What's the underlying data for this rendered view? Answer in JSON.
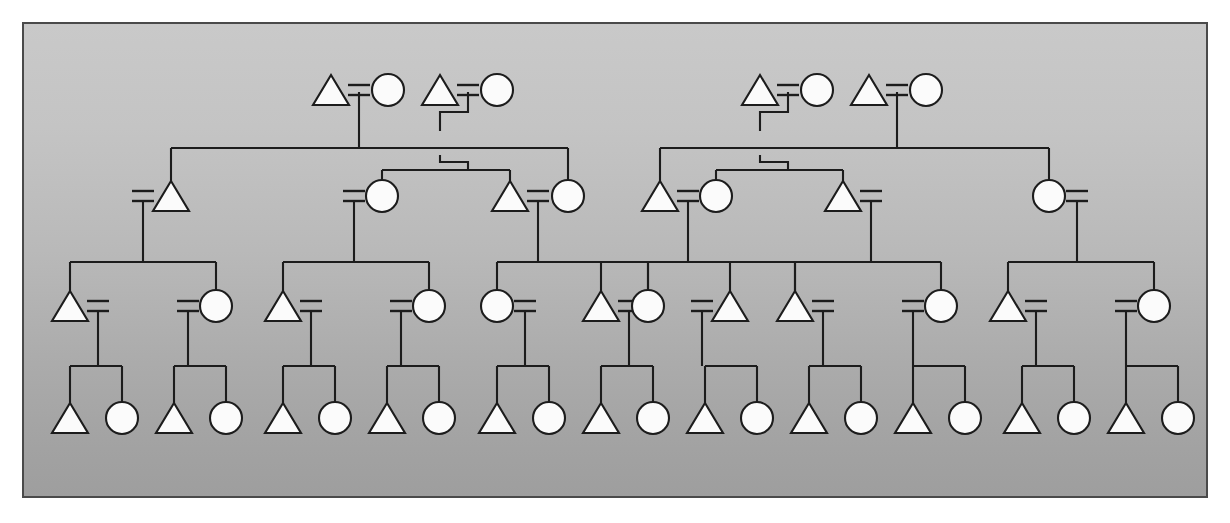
{
  "figure": {
    "panel": {
      "x": 22,
      "y": 22,
      "width": 1186,
      "height": 476,
      "border_color": "#4a4a4a",
      "background_top_color": "#c9c9c9",
      "background_bottom_color": "#9e9e9e"
    },
    "symbol_legend": {
      "triangle": "male",
      "circle": "female",
      "equals": "marriage-union",
      "vertical_line": "descent-line",
      "horizontal_line": "sibling-bar"
    },
    "stroke_color": "#1c1c1c",
    "shape_fill_color": "#fbfbfb",
    "generation_count": 4,
    "generations": [
      {
        "label": "generation-1",
        "y": 90,
        "node_count": 4
      },
      {
        "label": "generation-2",
        "y": 196,
        "node_count": 8
      },
      {
        "label": "generation-3",
        "y": 306,
        "node_count": 14
      },
      {
        "label": "generation-4",
        "y": 418,
        "node_count": 22
      }
    ]
  },
  "chart_data": {
    "type": "diagram",
    "subtype": "kinship-genealogy",
    "nodes_gen1": [
      {
        "id": "g1a",
        "shape": "triangle",
        "sex": "male",
        "x": 331,
        "y": 90
      },
      {
        "id": "g1b",
        "shape": "circle",
        "sex": "female",
        "x": 388,
        "y": 90
      },
      {
        "id": "g1c",
        "shape": "triangle",
        "sex": "male",
        "x": 440,
        "y": 90
      },
      {
        "id": "g1d",
        "shape": "circle",
        "sex": "female",
        "x": 497,
        "y": 90
      },
      {
        "id": "g1e",
        "shape": "triangle",
        "sex": "male",
        "x": 760,
        "y": 90
      },
      {
        "id": "g1f",
        "shape": "circle",
        "sex": "female",
        "x": 817,
        "y": 90
      },
      {
        "id": "g1g",
        "shape": "triangle",
        "sex": "male",
        "x": 869,
        "y": 90
      },
      {
        "id": "g1h",
        "shape": "circle",
        "sex": "female",
        "x": 926,
        "y": 90
      }
    ],
    "unions_gen1": [
      {
        "id": "u1",
        "left": "g1a",
        "right": "g1b",
        "x": 359,
        "y": 90,
        "descent_x": 331,
        "type": "straight"
      },
      {
        "id": "u2",
        "left": "g1c",
        "right": "g1d",
        "x": 468,
        "y": 90,
        "descent_x": 468,
        "type": "jog"
      },
      {
        "id": "u3",
        "left": "g1e",
        "right": "g1f",
        "x": 788,
        "y": 90,
        "descent_x": 788,
        "type": "jog"
      },
      {
        "id": "u4",
        "left": "g1g",
        "right": "g1h",
        "x": 897,
        "y": 90,
        "descent_x": 897,
        "type": "straight"
      }
    ],
    "nodes_gen2": [
      {
        "id": "g2a",
        "shape": "triangle",
        "sex": "male",
        "x": 171,
        "y": 196,
        "eq_side": "left"
      },
      {
        "id": "g2b",
        "shape": "circle",
        "sex": "female",
        "x": 382,
        "y": 196,
        "eq_side": "left"
      },
      {
        "id": "g2c",
        "shape": "triangle",
        "sex": "male",
        "x": 510,
        "y": 196,
        "eq_side": "right"
      },
      {
        "id": "g2d",
        "shape": "circle",
        "sex": "female",
        "x": 568,
        "y": 196,
        "eq_side": "none"
      },
      {
        "id": "g2e",
        "shape": "triangle",
        "sex": "male",
        "x": 660,
        "y": 196,
        "eq_side": "right"
      },
      {
        "id": "g2f",
        "shape": "circle",
        "sex": "female",
        "x": 716,
        "y": 196,
        "eq_side": "none"
      },
      {
        "id": "g2g",
        "shape": "triangle",
        "sex": "male",
        "x": 843,
        "y": 196,
        "eq_side": "right"
      },
      {
        "id": "g2h",
        "shape": "circle",
        "sex": "female",
        "x": 1049,
        "y": 196,
        "eq_side": "right"
      }
    ],
    "nodes_gen3": [
      {
        "id": "g3a",
        "shape": "triangle",
        "sex": "male",
        "x": 70,
        "y": 306,
        "eq_side": "right"
      },
      {
        "id": "g3b",
        "shape": "circle",
        "sex": "female",
        "x": 216,
        "y": 306,
        "eq_side": "left"
      },
      {
        "id": "g3c",
        "shape": "triangle",
        "sex": "male",
        "x": 283,
        "y": 306,
        "eq_side": "right"
      },
      {
        "id": "g3d",
        "shape": "circle",
        "sex": "female",
        "x": 429,
        "y": 306,
        "eq_side": "left"
      },
      {
        "id": "g3e",
        "shape": "circle",
        "sex": "female",
        "x": 497,
        "y": 306,
        "eq_side": "right"
      },
      {
        "id": "g3f",
        "shape": "triangle",
        "sex": "male",
        "x": 601,
        "y": 306,
        "eq_side": "right"
      },
      {
        "id": "g3g",
        "shape": "circle",
        "sex": "female",
        "x": 648,
        "y": 306,
        "eq_side": "none"
      },
      {
        "id": "g3h",
        "shape": "triangle",
        "sex": "male",
        "x": 730,
        "y": 306,
        "eq_side": "left"
      },
      {
        "id": "g3i",
        "shape": "triangle",
        "sex": "male",
        "x": 795,
        "y": 306,
        "eq_side": "right"
      },
      {
        "id": "g3j",
        "shape": "circle",
        "sex": "female",
        "x": 941,
        "y": 306,
        "eq_side": "left"
      },
      {
        "id": "g3k",
        "shape": "triangle",
        "sex": "male",
        "x": 1008,
        "y": 306,
        "eq_side": "right"
      },
      {
        "id": "g3l",
        "shape": "circle",
        "sex": "female",
        "x": 1154,
        "y": 306,
        "eq_side": "left"
      }
    ],
    "nodes_gen4": [
      {
        "id": "g4a",
        "shape": "triangle",
        "sex": "male",
        "x": 70,
        "y": 418
      },
      {
        "id": "g4b",
        "shape": "circle",
        "sex": "female",
        "x": 122,
        "y": 418
      },
      {
        "id": "g4c",
        "shape": "triangle",
        "sex": "male",
        "x": 174,
        "y": 418
      },
      {
        "id": "g4d",
        "shape": "circle",
        "sex": "female",
        "x": 226,
        "y": 418
      },
      {
        "id": "g4e",
        "shape": "triangle",
        "sex": "male",
        "x": 283,
        "y": 418
      },
      {
        "id": "g4f",
        "shape": "circle",
        "sex": "female",
        "x": 335,
        "y": 418
      },
      {
        "id": "g4g",
        "shape": "triangle",
        "sex": "male",
        "x": 387,
        "y": 418
      },
      {
        "id": "g4h",
        "shape": "circle",
        "sex": "female",
        "x": 439,
        "y": 418
      },
      {
        "id": "g4i",
        "shape": "triangle",
        "sex": "male",
        "x": 497,
        "y": 418
      },
      {
        "id": "g4j",
        "shape": "circle",
        "sex": "female",
        "x": 549,
        "y": 418
      },
      {
        "id": "g4k",
        "shape": "triangle",
        "sex": "male",
        "x": 601,
        "y": 418
      },
      {
        "id": "g4l",
        "shape": "circle",
        "sex": "female",
        "x": 653,
        "y": 418
      },
      {
        "id": "g4m",
        "shape": "triangle",
        "sex": "male",
        "x": 705,
        "y": 418
      },
      {
        "id": "g4n",
        "shape": "circle",
        "sex": "female",
        "x": 757,
        "y": 418
      },
      {
        "id": "g4o",
        "shape": "triangle",
        "sex": "male",
        "x": 809,
        "y": 418
      },
      {
        "id": "g4p",
        "shape": "circle",
        "sex": "female",
        "x": 861,
        "y": 418
      },
      {
        "id": "g4q",
        "shape": "triangle",
        "sex": "male",
        "x": 913,
        "y": 418
      },
      {
        "id": "g4r",
        "shape": "circle",
        "sex": "female",
        "x": 965,
        "y": 418
      },
      {
        "id": "g4s",
        "shape": "triangle",
        "sex": "male",
        "x": 1022,
        "y": 418
      },
      {
        "id": "g4t",
        "shape": "circle",
        "sex": "female",
        "x": 1074,
        "y": 418
      },
      {
        "id": "g4u",
        "shape": "triangle",
        "sex": "male",
        "x": 1126,
        "y": 418
      },
      {
        "id": "g4v",
        "shape": "circle",
        "sex": "female",
        "x": 1178,
        "y": 418
      }
    ],
    "sibling_bars_gen2": [
      {
        "id": "sb1",
        "y": 148,
        "x1": 171,
        "x2": 568,
        "descent_x": 331
      },
      {
        "id": "sb2",
        "y": 170,
        "x1": 382,
        "x2": 510,
        "descent_x": 468
      },
      {
        "id": "sb3",
        "y": 148,
        "x1": 660,
        "x2": 1049,
        "descent_x": 897
      },
      {
        "id": "sb4",
        "y": 170,
        "x1": 716,
        "x2": 843,
        "descent_x": 788
      }
    ],
    "sibling_bars_gen3": [
      {
        "id": "sb5",
        "y": 262,
        "x1": 70,
        "x2": 216,
        "parent_x": 143
      },
      {
        "id": "sb6",
        "y": 262,
        "x1": 283,
        "x2": 429,
        "parent_x": 356
      },
      {
        "id": "sb7",
        "y": 262,
        "x1": 497,
        "x2": 648,
        "parent_x": 540
      },
      {
        "id": "sb8",
        "y": 262,
        "x1": 648,
        "x2": 795,
        "parent_x": 690
      },
      {
        "id": "sb9",
        "y": 262,
        "x1": 795,
        "x2": 941,
        "parent_x": 872
      },
      {
        "id": "sb10",
        "y": 262,
        "x1": 1008,
        "x2": 1154,
        "parent_x": 1081
      }
    ],
    "sibling_bars_gen4": [
      {
        "id": "sb11",
        "y": 366,
        "x1": 70,
        "x2": 122,
        "parent_x": 96
      },
      {
        "id": "sb12",
        "y": 366,
        "x1": 174,
        "x2": 226,
        "parent_x": 200
      },
      {
        "id": "sb13",
        "y": 366,
        "x1": 283,
        "x2": 335,
        "parent_x": 309
      },
      {
        "id": "sb14",
        "y": 366,
        "x1": 387,
        "x2": 439,
        "parent_x": 413
      },
      {
        "id": "sb15",
        "y": 366,
        "x1": 497,
        "x2": 549,
        "parent_x": 523
      },
      {
        "id": "sb16",
        "y": 366,
        "x1": 601,
        "x2": 653,
        "parent_x": 627
      },
      {
        "id": "sb17",
        "y": 366,
        "x1": 705,
        "x2": 757,
        "parent_x": 731
      },
      {
        "id": "sb18",
        "y": 366,
        "x1": 809,
        "x2": 861,
        "parent_x": 835
      },
      {
        "id": "sb19",
        "y": 366,
        "x1": 913,
        "x2": 965,
        "parent_x": 939
      },
      {
        "id": "sb20",
        "y": 366,
        "x1": 1022,
        "x2": 1074,
        "parent_x": 1048
      },
      {
        "id": "sb21",
        "y": 366,
        "x1": 1126,
        "x2": 1178,
        "parent_x": 1152
      }
    ],
    "geometry": {
      "triangle_half_width": 18,
      "triangle_height": 30,
      "circle_radius": 16,
      "equals_offset": 28,
      "equals_half_width": 11,
      "equals_gap": 5
    }
  }
}
